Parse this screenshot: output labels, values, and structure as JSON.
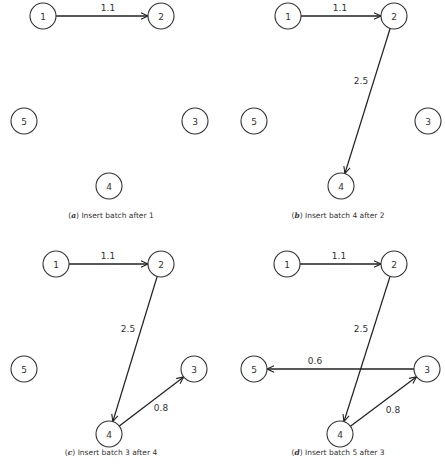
{
  "figure": {
    "node_radius": 13,
    "panels": [
      {
        "id": "a",
        "caption_letter": "a",
        "caption_text": "Insert batch after 1",
        "caption_pos": [
          111,
          218
        ],
        "nodes": [
          {
            "id": "1",
            "label": "1",
            "x": 43,
            "y": 16
          },
          {
            "id": "2",
            "label": "2",
            "x": 161,
            "y": 16
          },
          {
            "id": "3",
            "label": "3",
            "x": 195,
            "y": 121
          },
          {
            "id": "4",
            "label": "4",
            "x": 109,
            "y": 186
          },
          {
            "id": "5",
            "label": "5",
            "x": 24,
            "y": 121
          }
        ],
        "edges": [
          {
            "from": "1",
            "to": "2",
            "label": "1.1",
            "label_pos": [
              108,
              11
            ]
          }
        ]
      },
      {
        "id": "b",
        "caption_letter": "b",
        "caption_text": "Insert batch 4 after 2",
        "caption_pos": [
          338,
          218
        ],
        "nodes": [
          {
            "id": "1",
            "label": "1",
            "x": 288,
            "y": 16
          },
          {
            "id": "2",
            "label": "2",
            "x": 394,
            "y": 16
          },
          {
            "id": "3",
            "label": "3",
            "x": 428,
            "y": 121
          },
          {
            "id": "4",
            "label": "4",
            "x": 341,
            "y": 186
          },
          {
            "id": "5",
            "label": "5",
            "x": 254,
            "y": 121
          }
        ],
        "edges": [
          {
            "from": "1",
            "to": "2",
            "label": "1.1",
            "label_pos": [
              340,
              11
            ]
          },
          {
            "from": "2",
            "to": "4",
            "label": "2.5",
            "label_pos": [
              361,
              84
            ]
          }
        ]
      },
      {
        "id": "c",
        "caption_letter": "c",
        "caption_text": "Insert batch 3 after 4",
        "caption_pos": [
          111,
          455
        ],
        "nodes": [
          {
            "id": "1",
            "label": "1",
            "x": 56,
            "y": 264
          },
          {
            "id": "2",
            "label": "2",
            "x": 161,
            "y": 264
          },
          {
            "id": "3",
            "label": "3",
            "x": 194,
            "y": 369
          },
          {
            "id": "4",
            "label": "4",
            "x": 109,
            "y": 434
          },
          {
            "id": "5",
            "label": "5",
            "x": 24,
            "y": 369
          }
        ],
        "edges": [
          {
            "from": "1",
            "to": "2",
            "label": "1.1",
            "label_pos": [
              108,
              259
            ]
          },
          {
            "from": "2",
            "to": "4",
            "label": "2.5",
            "label_pos": [
              128,
              332
            ]
          },
          {
            "from": "4",
            "to": "3",
            "label": "0.8",
            "label_pos": [
              161,
              411
            ]
          }
        ]
      },
      {
        "id": "d",
        "caption_letter": "d",
        "caption_text": "Insert batch 5 after 3",
        "caption_pos": [
          338,
          455
        ],
        "nodes": [
          {
            "id": "1",
            "label": "1",
            "x": 287,
            "y": 264
          },
          {
            "id": "2",
            "label": "2",
            "x": 394,
            "y": 264
          },
          {
            "id": "3",
            "label": "3",
            "x": 427,
            "y": 369
          },
          {
            "id": "4",
            "label": "4",
            "x": 340,
            "y": 434
          },
          {
            "id": "5",
            "label": "5",
            "x": 254,
            "y": 369
          }
        ],
        "edges": [
          {
            "from": "1",
            "to": "2",
            "label": "1.1",
            "label_pos": [
              339,
              259
            ]
          },
          {
            "from": "2",
            "to": "4",
            "label": "2.5",
            "label_pos": [
              361,
              332
            ]
          },
          {
            "from": "4",
            "to": "3",
            "label": "0.8",
            "label_pos": [
              393,
              413
            ]
          },
          {
            "from": "3",
            "to": "5",
            "label": "0.6",
            "label_pos": [
              315,
              364
            ]
          }
        ]
      }
    ]
  }
}
